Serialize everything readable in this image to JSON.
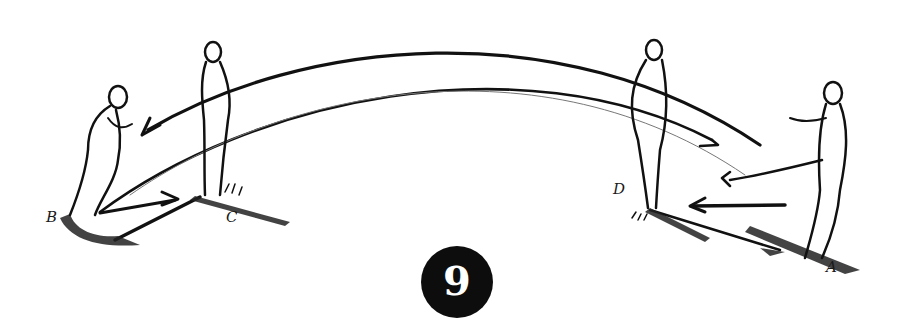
{
  "figure": {
    "number": "9",
    "players": [
      {
        "id": "A",
        "label": "A",
        "pose": "kicking"
      },
      {
        "id": "B",
        "label": "B",
        "pose": "receiving"
      },
      {
        "id": "C",
        "label": "C",
        "pose": "standing"
      },
      {
        "id": "D",
        "label": "D",
        "pose": "standing"
      }
    ],
    "passes": [
      {
        "from": "A",
        "to": "B",
        "type": "lofted-arc"
      },
      {
        "from": "B",
        "to": "C",
        "type": "ground"
      },
      {
        "from": "C",
        "to": "B",
        "type": "ground"
      },
      {
        "from": "A",
        "to": "D",
        "type": "ground"
      },
      {
        "from": "D",
        "to": "A",
        "type": "ground"
      }
    ],
    "colors": {
      "ink": "#111111",
      "badge": "#0d0d0d",
      "badge_text": "#ffffff",
      "background": "#ffffff"
    }
  }
}
